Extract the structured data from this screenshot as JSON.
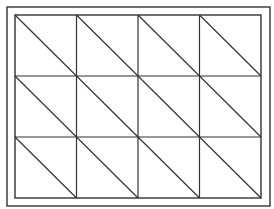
{
  "diagram": {
    "type": "triangulated-grid",
    "rows": 3,
    "cols": 4,
    "diagonal_direction": "top-left-to-bottom-right",
    "stroke_color": "#333333",
    "background_color": "#ffffff",
    "outer_frame": {
      "x": 7,
      "y": 7,
      "width": 263,
      "height": 199
    },
    "inner_grid": {
      "x": 15,
      "y": 15,
      "width": 246,
      "height": 183
    }
  }
}
